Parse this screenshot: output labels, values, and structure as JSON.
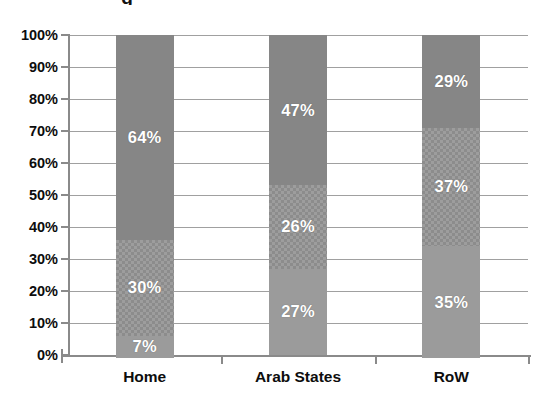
{
  "title_remnant": "g",
  "axes": {
    "y_tick_labels": [
      "100%",
      "90%",
      "80%",
      "70%",
      "60%",
      "50%",
      "40%",
      "30%",
      "20%",
      "10%",
      "0%"
    ],
    "y_axis_label": "",
    "x_axis_label": ""
  },
  "colors": {
    "segment_bottom": "#9b9b9b",
    "segment_middle": "#9d9d9d",
    "segment_top": "#868686",
    "gridline": "#a0a0a0",
    "axis": "#8a8a8a",
    "label_text": "#0d0d0d",
    "data_label_text": "#ffffff",
    "background": "#ffffff"
  },
  "chart_data": {
    "type": "bar",
    "subtype": "100% stacked bar",
    "title": "",
    "xlabel": "",
    "ylabel": "",
    "ylim": [
      0,
      100
    ],
    "ytick_step": 10,
    "yunit": "%",
    "grid": true,
    "legend": false,
    "legend_position": "none",
    "categories": [
      "Home",
      "Arab States",
      "RoW"
    ],
    "series": [
      {
        "name": "series-1",
        "style": "solid-light",
        "stack_position": "bottom",
        "values": [
          7,
          27,
          35
        ],
        "labels": [
          "7%",
          "27%",
          "35%"
        ]
      },
      {
        "name": "series-2",
        "style": "checker",
        "stack_position": "middle",
        "values": [
          30,
          26,
          37
        ],
        "labels": [
          "30%",
          "26%",
          "37%"
        ]
      },
      {
        "name": "series-3",
        "style": "solid-dark",
        "stack_position": "top",
        "values": [
          64,
          47,
          29
        ],
        "labels": [
          "64%",
          "47%",
          "29%"
        ]
      }
    ],
    "bars": [
      {
        "category": "Home",
        "segments": [
          {
            "label": "7%",
            "value": 7,
            "style": "solid-light"
          },
          {
            "label": "30%",
            "value": 30,
            "style": "checker"
          },
          {
            "label": "64%",
            "value": 64,
            "style": "solid-dark"
          }
        ]
      },
      {
        "category": "Arab States",
        "segments": [
          {
            "label": "27%",
            "value": 27,
            "style": "solid-light"
          },
          {
            "label": "26%",
            "value": 26,
            "style": "checker"
          },
          {
            "label": "47%",
            "value": 47,
            "style": "solid-dark"
          }
        ]
      },
      {
        "category": "RoW",
        "segments": [
          {
            "label": "35%",
            "value": 35,
            "style": "solid-light"
          },
          {
            "label": "37%",
            "value": 37,
            "style": "checker"
          },
          {
            "label": "29%",
            "value": 29,
            "style": "solid-dark"
          }
        ]
      }
    ]
  }
}
